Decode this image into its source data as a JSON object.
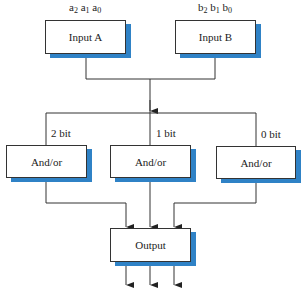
{
  "diagram": {
    "inputs": [
      {
        "label": "Input A",
        "bits": [
          {
            "base": "a",
            "idx": "2"
          },
          {
            "base": "a",
            "idx": "1"
          },
          {
            "base": "a",
            "idx": "0"
          }
        ]
      },
      {
        "label": "Input B",
        "bits": [
          {
            "base": "b",
            "idx": "2"
          },
          {
            "base": "b",
            "idx": "1"
          },
          {
            "base": "b",
            "idx": "0"
          }
        ]
      }
    ],
    "gates": [
      {
        "label": "And/or",
        "bit_label": "2 bit"
      },
      {
        "label": "And/or",
        "bit_label": "1 bit"
      },
      {
        "label": "And/or",
        "bit_label": "0 bit"
      }
    ],
    "output": {
      "label": "Output"
    },
    "colors": {
      "shadow": "#2f82c6",
      "line": "#333333"
    }
  }
}
